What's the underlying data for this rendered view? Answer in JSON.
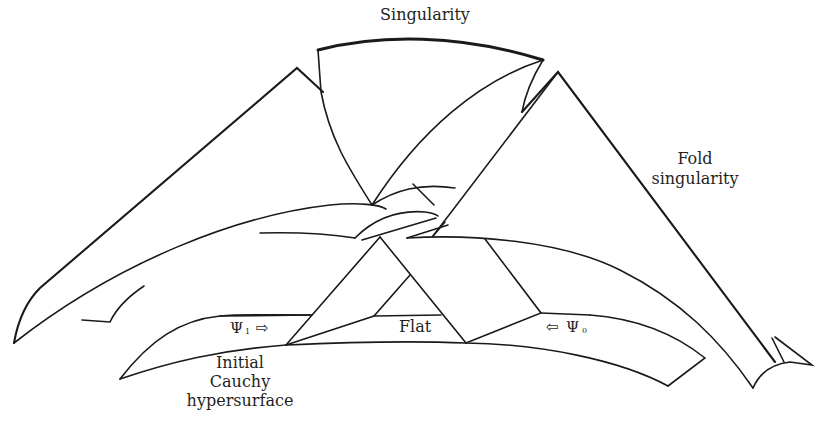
{
  "figure": {
    "labels": {
      "singularity": "Singularity",
      "fold_line1": "Fold",
      "fold_line2": "singularity",
      "flat": "Flat",
      "initial_line1": "Initial",
      "initial_line2": "Cauchy",
      "initial_line3": "hypersurface"
    },
    "waves": {
      "left_symbol": "Ψ",
      "left_subscript": "1",
      "left_arrow": "⇨",
      "right_symbol": "Ψ",
      "right_subscript": "0",
      "right_arrow": "⇦"
    },
    "colors": {
      "line": "#1a1a1a",
      "background": "#ffffff"
    }
  }
}
